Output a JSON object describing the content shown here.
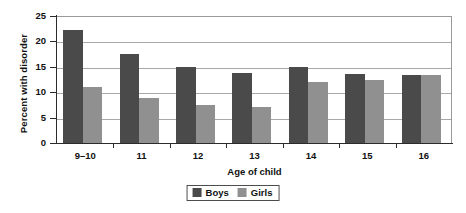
{
  "chart_data": {
    "type": "bar",
    "title": "",
    "xlabel": "Age of child",
    "ylabel": "Percent with disorder",
    "categories": [
      "9–10",
      "11",
      "12",
      "13",
      "14",
      "15",
      "16"
    ],
    "series": [
      {
        "name": "Boys",
        "color": "#4a4a4a",
        "values": [
          22.2,
          17.5,
          14.9,
          13.8,
          14.9,
          13.6,
          13.4
        ]
      },
      {
        "name": "Girls",
        "color": "#909090",
        "values": [
          11.0,
          8.8,
          7.4,
          7.0,
          12.0,
          12.4,
          13.4
        ]
      }
    ],
    "ylim": [
      0,
      25
    ],
    "yticks": [
      0,
      5,
      10,
      15,
      20,
      25
    ],
    "ytick_labels": [
      "0",
      "5",
      "10",
      "15",
      "20",
      "25"
    ],
    "grid": "horizontal",
    "legend_position": "bottom-center"
  },
  "legend": {
    "entries": [
      {
        "label": "Boys"
      },
      {
        "label": "Girls"
      }
    ]
  }
}
